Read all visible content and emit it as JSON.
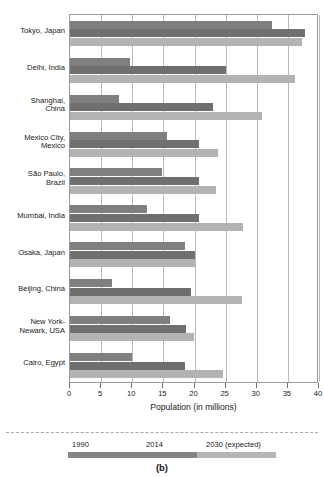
{
  "chart_data": {
    "type": "bar",
    "orientation": "horizontal",
    "title": "",
    "xlabel": "Population (in millions)",
    "ylabel": "",
    "xlim": [
      0,
      40
    ],
    "xticks": [
      0,
      5,
      10,
      15,
      20,
      25,
      30,
      35,
      40
    ],
    "grid": "vertical",
    "legend_position": "below",
    "categories": [
      "Tokyo, Japan",
      "Delhi, India",
      "Shanghai,\nChina",
      "Mexico City,\nMexico",
      "São Paulo,\nBrazil",
      "Mumbai, India",
      "Osaka, Japan",
      "Beijing, China",
      "New York-\nNewark, USA",
      "Cairo, Egypt"
    ],
    "series": [
      {
        "name": "1990",
        "color": "#7f7f7f",
        "values": [
          32.5,
          9.7,
          7.8,
          15.6,
          14.8,
          12.4,
          18.4,
          6.8,
          16.1,
          9.9
        ]
      },
      {
        "name": "2014",
        "color": "#6f6f6f",
        "values": [
          37.8,
          25.0,
          23.0,
          20.8,
          20.8,
          20.7,
          20.1,
          19.5,
          18.6,
          18.4
        ]
      },
      {
        "name": "2030 (expected)",
        "color": "#b3b3b3",
        "values": [
          37.2,
          36.1,
          30.8,
          23.8,
          23.4,
          27.8,
          20.0,
          27.7,
          19.9,
          24.5
        ]
      }
    ]
  },
  "legend": {
    "items": [
      "1990",
      "2014",
      "2030 (expected)"
    ]
  },
  "caption": "(b)"
}
